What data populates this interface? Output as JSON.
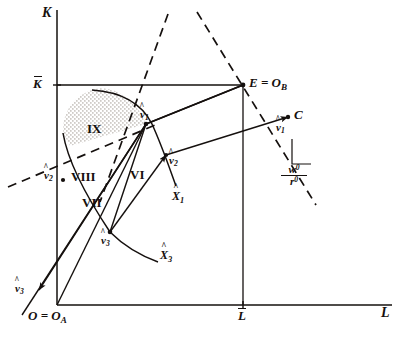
{
  "figure": {
    "type": "economics-production-diagram",
    "ink_color": "#15100e",
    "background_color": "#ffffff",
    "stipple_color": "#8a8278"
  },
  "axes": {
    "vertical_label": "K",
    "horizontal_label": "L",
    "origin_label": "O = O",
    "origin_sub": "A",
    "k_bar_label": "K",
    "l_bar_label": "L"
  },
  "points": {
    "E_label": "E = O",
    "E_sub": "B",
    "C_label": "C"
  },
  "vectors": [
    {
      "id": "v1-center",
      "label": "v",
      "sub": "1"
    },
    {
      "id": "v1-right",
      "label": "v",
      "sub": "1"
    },
    {
      "id": "v2-center",
      "label": "v",
      "sub": "2"
    },
    {
      "id": "v2-left",
      "label": "v",
      "sub": "2"
    },
    {
      "id": "v3-center",
      "label": "v",
      "sub": "3"
    },
    {
      "id": "v3-arrow",
      "label": "v",
      "sub": "3"
    }
  ],
  "isoquants": [
    {
      "id": "X1",
      "label": "X",
      "sub": "1"
    },
    {
      "id": "X3",
      "label": "X",
      "sub": "3"
    }
  ],
  "regions": [
    {
      "id": "region-ix",
      "label": "IX",
      "shaded": true
    },
    {
      "id": "region-viii",
      "label": "VIII",
      "shaded": false
    },
    {
      "id": "region-vii",
      "label": "VII",
      "shaded": false
    },
    {
      "id": "region-vi",
      "label": "VI",
      "shaded": false
    }
  ],
  "slope_indicator": {
    "numerator": "w",
    "numerator_sup": "0",
    "denominator": "r",
    "denominator_sup": "0"
  }
}
